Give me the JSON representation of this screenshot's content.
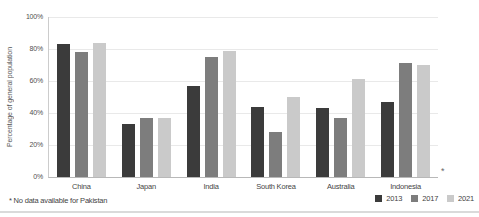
{
  "chart_data": {
    "type": "bar",
    "title": "",
    "xlabel": "",
    "ylabel": "Percentage of general population",
    "ylim": [
      0,
      100
    ],
    "grid": "horizontal",
    "legend_position": "bottom-right",
    "yticks": [
      {
        "label": "0%",
        "value": 0
      },
      {
        "label": "20%",
        "value": 20
      },
      {
        "label": "40%",
        "value": 40
      },
      {
        "label": "60%",
        "value": 60
      },
      {
        "label": "80%",
        "value": 80
      },
      {
        "label": "100%",
        "value": 100
      }
    ],
    "categories": [
      "China",
      "Japan",
      "India",
      "South Korea",
      "Australia",
      "Indonesia"
    ],
    "series": [
      {
        "name": "2013",
        "color": "#3b3b3b",
        "values": [
          83,
          33,
          57,
          44,
          43,
          47
        ]
      },
      {
        "name": "2017",
        "color": "#7d7d7d",
        "values": [
          78,
          37,
          75,
          28,
          37,
          71
        ]
      },
      {
        "name": "2021",
        "color": "#cacaca",
        "values": [
          84,
          37,
          79,
          50,
          61,
          70
        ]
      }
    ],
    "no_data_marker": "*"
  },
  "footnote": "* No data available for Pakistan"
}
